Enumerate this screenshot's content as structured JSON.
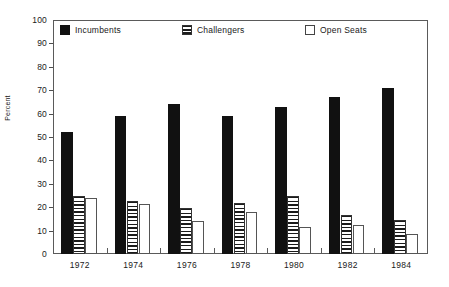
{
  "chart_data": {
    "type": "bar",
    "title": "",
    "xlabel": "",
    "ylabel": "Percent",
    "ylim": [
      0,
      100
    ],
    "ytick_step": 10,
    "grid": false,
    "legend_position": "top-inside",
    "categories": [
      "1972",
      "1974",
      "1976",
      "1978",
      "1980",
      "1982",
      "1984"
    ],
    "yticks": [
      "0",
      "10",
      "20",
      "30",
      "40",
      "50",
      "60",
      "70",
      "80",
      "90",
      "100"
    ],
    "series": [
      {
        "name": "Incumbents",
        "fill": "solid-black",
        "color": "#111111",
        "values": [
          52,
          59,
          64,
          59,
          63,
          67,
          71
        ]
      },
      {
        "name": "Challengers",
        "fill": "horizontal-hatch",
        "color": "#1b1b1b",
        "values": [
          25,
          22.5,
          19.5,
          22,
          25,
          16.5,
          14.5
        ]
      },
      {
        "name": "Open Seats",
        "fill": "empty-white",
        "color": "#ffffff",
        "values": [
          24,
          21.5,
          14,
          18,
          11.5,
          12.5,
          8.5
        ]
      }
    ]
  },
  "axes": {
    "y_title": "Percent"
  },
  "legend": {
    "items": [
      {
        "label": "Incumbents"
      },
      {
        "label": "Challengers"
      },
      {
        "label": "Open Seats"
      }
    ]
  }
}
